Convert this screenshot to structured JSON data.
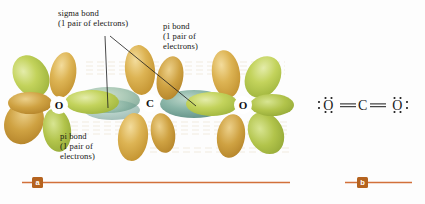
{
  "figure": {
    "background_color": "#fdfdfd",
    "rule_color": "#d2703a",
    "marker_color": "#b5631f"
  },
  "panel_a": {
    "marker": "a",
    "description": "orbital overlap diagram of CO2",
    "atoms": [
      {
        "symbol": "O",
        "x": 59,
        "y": 105
      },
      {
        "symbol": "C",
        "x": 150,
        "y": 103
      },
      {
        "symbol": "O",
        "x": 243,
        "y": 105
      }
    ],
    "annotations": [
      {
        "name": "sigma-bond-label",
        "line1": "sigma bond",
        "line2": "(1 pair of electrons)",
        "text": "sigma bond\n(1 pair of electrons)"
      },
      {
        "name": "pi-bond-label-top",
        "line1": "pi bond",
        "line2": "(1 pair of",
        "line3": "electrons)",
        "text": "pi bond\n(1 pair of\nelectrons)"
      },
      {
        "name": "pi-bond-label-bottom",
        "line1": "pi bond",
        "line2": "(1 pair of",
        "line3": "electrons)",
        "text": "pi bond\n(1 pair of\nelectrons)"
      }
    ],
    "colors": {
      "green_lobe": "#b6c84a",
      "green_lobe_light": "#d6e07c",
      "gold_lobe": "#d6a93f",
      "gold_lobe_light": "#e8cc7e",
      "pi_cloud": "#5f9490",
      "pi_cloud_light": "#9cc3b8",
      "atom_disc": "#ffffff",
      "atom_text": "#111111"
    }
  },
  "panel_b": {
    "marker": "b",
    "description": "Lewis structure of carbon dioxide",
    "formula": "O=C=O",
    "lewis_text": "O═C═O",
    "lone_pairs_per_oxygen": 2,
    "atoms": [
      "O",
      "C",
      "O"
    ]
  }
}
